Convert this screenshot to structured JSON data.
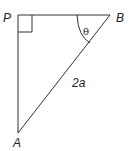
{
  "diagram": {
    "type": "right-triangle",
    "vertices": {
      "P": {
        "label": "P",
        "x": 18,
        "y": 15
      },
      "B": {
        "label": "B",
        "x": 110,
        "y": 15
      },
      "A": {
        "label": "A",
        "x": 18,
        "y": 133
      }
    },
    "right_angle_at": "P",
    "angle_label": "θ",
    "angle_at": "B",
    "hypotenuse_label": "2a",
    "line_color": "#333333"
  }
}
